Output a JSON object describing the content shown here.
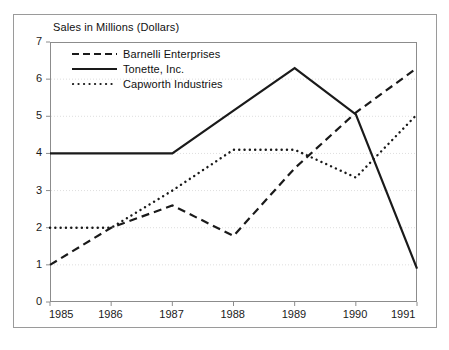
{
  "chart_data": {
    "type": "line",
    "title": "Sales in Millions (Dollars)",
    "xlabel": "",
    "ylabel": "",
    "x": [
      1985,
      1986,
      1987,
      1988,
      1989,
      1990,
      1991
    ],
    "categories": [
      "1985",
      "1986",
      "1987",
      "1988",
      "1989",
      "1990",
      "1991"
    ],
    "xlim": [
      1985,
      1991
    ],
    "ylim": [
      0,
      7
    ],
    "yticks": [
      0,
      1,
      2,
      3,
      4,
      5,
      6,
      7
    ],
    "ytick_labels": [
      "0",
      "1",
      "2",
      "3",
      "4",
      "5",
      "6",
      "7"
    ],
    "grid": true,
    "grid_axis": "y",
    "legend_position": "top-left-inside",
    "series": [
      {
        "name": "Barnelli Enterprises",
        "style": "dashed",
        "color": "#1a1a1a",
        "values": [
          1.0,
          2.0,
          2.6,
          1.78,
          3.6,
          5.1,
          6.3
        ]
      },
      {
        "name": "Tonette, Inc.",
        "style": "solid",
        "color": "#1a1a1a",
        "values": [
          4.0,
          4.0,
          4.0,
          5.15,
          6.3,
          5.05,
          0.9
        ]
      },
      {
        "name": "Capworth Industries",
        "style": "dotted",
        "color": "#1a1a1a",
        "values": [
          2.0,
          2.0,
          3.0,
          4.1,
          4.1,
          3.35,
          5.05
        ]
      }
    ]
  },
  "axis": {
    "y_labels": [
      "7",
      "6",
      "5",
      "4",
      "3",
      "2",
      "1",
      "0"
    ],
    "x_labels": [
      "1985",
      "1986",
      "1987",
      "1988",
      "1989",
      "1990",
      "1991"
    ]
  },
  "legend": {
    "items": [
      {
        "label": "Barnelli Enterprises",
        "style": "dashed"
      },
      {
        "label": "Tonette, Inc.",
        "style": "solid"
      },
      {
        "label": "Capworth Industries",
        "style": "dotted"
      }
    ]
  },
  "colors": {
    "line": "#1a1a1a",
    "grid": "#dedede",
    "axis": "#8c8c8c",
    "frame": "#9a9a9a",
    "text": "#1a1a1a",
    "background": "#ffffff"
  }
}
